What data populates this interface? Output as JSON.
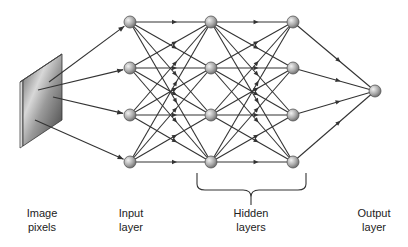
{
  "diagram": {
    "type": "feedforward-neural-network",
    "colors": {
      "edge": "#333333",
      "node_fill_light": "#e6e6e6",
      "node_fill_dark": "#7a7a7a",
      "node_stroke": "#555555",
      "panel_dark": "#555555",
      "panel_light": "#f0f0f0",
      "text": "#222222"
    },
    "layers": [
      {
        "id": "input",
        "x": 130,
        "nodes_y": [
          22,
          68,
          115,
          162
        ]
      },
      {
        "id": "hidden1",
        "x": 211,
        "nodes_y": [
          22,
          68,
          115,
          162
        ]
      },
      {
        "id": "hidden2",
        "x": 293,
        "nodes_y": [
          22,
          68,
          115,
          162
        ]
      },
      {
        "id": "output",
        "x": 375,
        "nodes_y": [
          91
        ]
      }
    ],
    "image_to_input_edges": [
      {
        "from": [
          49,
          82
        ],
        "to_node": 0
      },
      {
        "from": [
          38,
          90
        ],
        "to_node": 1
      },
      {
        "from": [
          53,
          97
        ],
        "to_node": 2
      },
      {
        "from": [
          35,
          120
        ],
        "to_node": 3
      }
    ]
  },
  "labels": {
    "image_pixels": {
      "line1": "Image",
      "line2": "pixels"
    },
    "input_layer": {
      "line1": "Input",
      "line2": "layer"
    },
    "hidden_layers": {
      "line1": "Hidden",
      "line2": "layers"
    },
    "output_layer": {
      "line1": "Output",
      "line2": "layer"
    }
  }
}
